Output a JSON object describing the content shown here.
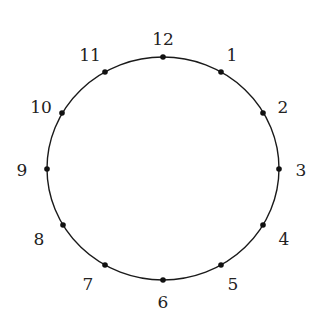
{
  "diagram": {
    "type": "clock-face-circle",
    "center": {
      "x": 163,
      "y": 168.5
    },
    "radius": {
      "x": 116,
      "y": 111.5
    },
    "stroke_color": "#1a1a1a",
    "point_color": "#111111",
    "points": [
      {
        "label": "12",
        "x": 163,
        "y": 57,
        "lx": 163,
        "ly": 39
      },
      {
        "label": "1",
        "x": 221,
        "y": 72,
        "lx": 232,
        "ly": 55
      },
      {
        "label": "2",
        "x": 263,
        "y": 113,
        "lx": 283,
        "ly": 107
      },
      {
        "label": "3",
        "x": 279,
        "y": 169,
        "lx": 301,
        "ly": 170
      },
      {
        "label": "4",
        "x": 263,
        "y": 225,
        "lx": 284,
        "ly": 239
      },
      {
        "label": "5",
        "x": 221,
        "y": 265,
        "lx": 233,
        "ly": 284
      },
      {
        "label": "6",
        "x": 163,
        "y": 280,
        "lx": 163,
        "ly": 302
      },
      {
        "label": "7",
        "x": 105,
        "y": 265,
        "lx": 88,
        "ly": 284
      },
      {
        "label": "8",
        "x": 63,
        "y": 225,
        "lx": 39,
        "ly": 239
      },
      {
        "label": "9",
        "x": 47,
        "y": 169,
        "lx": 22,
        "ly": 170
      },
      {
        "label": "10",
        "x": 62,
        "y": 113,
        "lx": 41,
        "ly": 107
      },
      {
        "label": "11",
        "x": 105,
        "y": 72,
        "lx": 90,
        "ly": 55
      }
    ]
  }
}
